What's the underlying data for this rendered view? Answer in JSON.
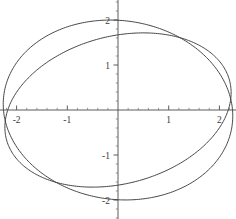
{
  "chart_data": {
    "type": "line",
    "title": "",
    "subtitle": "",
    "xlabel": "",
    "ylabel": "",
    "xlim": [
      -2.35,
      2.35
    ],
    "ylim": [
      -2.45,
      2.45
    ],
    "grid": false,
    "legend": null,
    "axes": {
      "style": "centered-crosshair",
      "origin": [
        0,
        0
      ],
      "x_major_ticks": [
        -2,
        -1,
        1,
        2
      ],
      "y_major_ticks": [
        -2,
        -1,
        1,
        2
      ],
      "x_tick_labels": [
        "-2",
        "-1",
        "1",
        "2"
      ],
      "y_tick_labels": [
        "-2",
        "-1",
        "1",
        "2"
      ],
      "x_minor_tick_step": 0.2,
      "y_minor_tick_step": 0.2
    },
    "series": [
      {
        "name": "ellipse-1",
        "type": "ellipse",
        "description": "ellipse tilted counter-clockwise, major axis up to the right",
        "center": [
          0,
          0
        ],
        "semi_major": 2.3,
        "semi_minor": 1.62,
        "rotation_deg": 20,
        "x_intercepts": [
          -2.17,
          2.17
        ],
        "y_intercepts": [
          -1.72,
          1.72
        ]
      },
      {
        "name": "ellipse-2",
        "type": "ellipse",
        "description": "ellipse tilted clockwise, major axis down to the right",
        "center": [
          0,
          0
        ],
        "semi_major": 2.28,
        "semi_minor": 1.98,
        "rotation_deg": -14,
        "x_intercepts": [
          -2.22,
          2.22
        ],
        "y_intercepts": [
          -2.0,
          2.0
        ]
      }
    ]
  },
  "figure": {
    "background_color": "#ffffff",
    "curve_color": "#3d3d3d",
    "axis_color": "#4a4a4a",
    "label_color": "#3a3a3a"
  }
}
